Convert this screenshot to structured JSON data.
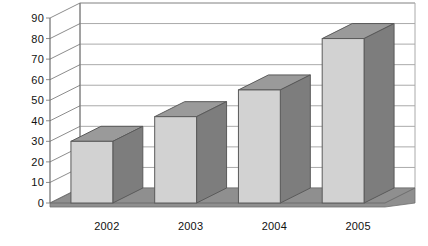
{
  "chart_data": {
    "type": "bar",
    "title": "",
    "subtitle": "",
    "xlabel": "",
    "ylabel": "",
    "categories": [
      "2002",
      "2003",
      "2004",
      "2005"
    ],
    "values": [
      30,
      42,
      55,
      80
    ],
    "ylim": [
      0,
      90
    ],
    "ytick_labels": [
      "0",
      "10",
      "20",
      "30",
      "40",
      "50",
      "60",
      "70",
      "80",
      "90"
    ],
    "ytick_values": [
      0,
      10,
      20,
      30,
      40,
      50,
      60,
      70,
      80,
      90
    ],
    "ytick_step": 10,
    "grid": true,
    "grid_axis": "y",
    "legend": false,
    "legend_position": "none",
    "annotations": [],
    "style": "3d-column",
    "colors": {
      "bar_front": "#d2d2d2",
      "bar_side": "#7d7d7d",
      "bar_top": "#9a9a9a",
      "bar_outline": "#5a5a5a",
      "floor": "#8f8f8f",
      "back_wall": "#ffffff",
      "grid_line": "#aaaaaa",
      "axis_line": "#6e6e6e",
      "text": "#111111"
    }
  }
}
